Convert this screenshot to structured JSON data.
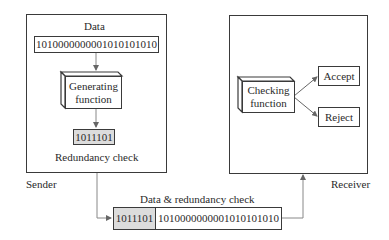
{
  "sender": {
    "label": "Sender",
    "data_label": "Data",
    "data_bits": "1010000000001010101010",
    "generator": "Generating function",
    "generator_line1": "Generating",
    "generator_line2": "function",
    "redundancy_bits": "1011101",
    "redundancy_label": "Redundancy check"
  },
  "channel": {
    "label": "Data & redundancy check",
    "redundancy_bits": "1011101",
    "data_bits": "1010000000001010101010"
  },
  "receiver": {
    "label": "Receiver",
    "checker_line1": "Checking",
    "checker_line2": "function",
    "accept": "Accept",
    "reject": "Reject"
  },
  "colors": {
    "line": "#3a3a3a",
    "arrow": "#777777",
    "shaded": "#dcdcdc"
  }
}
